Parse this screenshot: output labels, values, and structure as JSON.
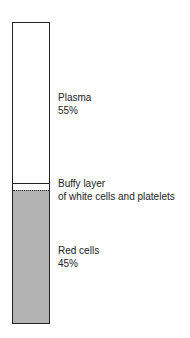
{
  "diagram": {
    "layers": [
      {
        "name": "Plasma",
        "percent": "55%"
      },
      {
        "name": "Buffy layer",
        "sublabel": "of white cells and platelets"
      },
      {
        "name": "Red cells",
        "percent": "45%"
      }
    ]
  }
}
